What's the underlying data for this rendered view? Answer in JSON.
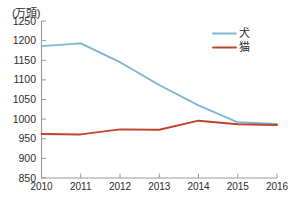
{
  "chart_data": {
    "type": "line",
    "title": "",
    "subtitle": "",
    "xlabel": "(年)",
    "ylabel": "(万頭)",
    "unit_note": "(万頭)",
    "x_unit_note": "(年)",
    "categories": [
      "2010",
      "2011",
      "2012",
      "2013",
      "2014",
      "2015",
      "2016"
    ],
    "x": [
      2010,
      2011,
      2012,
      2013,
      2014,
      2015,
      2016
    ],
    "xlim": [
      2010,
      2016
    ],
    "ylim": [
      850,
      1250
    ],
    "yticks": [
      "850",
      "900",
      "950",
      "1000",
      "1050",
      "1100",
      "1150",
      "1200",
      "1250"
    ],
    "ytick_values": [
      850,
      900,
      950,
      1000,
      1050,
      1100,
      1150,
      1200,
      1250
    ],
    "grid": false,
    "legend_position": "top-right",
    "series": [
      {
        "name": "犬",
        "color": "#7FB5D8",
        "values": [
          1186,
          1193,
          1145,
          1087,
          1035,
          992,
          988
        ]
      },
      {
        "name": "猫",
        "color": "#BE4430",
        "values": [
          962,
          961,
          974,
          973,
          996,
          987,
          985
        ]
      }
    ]
  },
  "legend": {
    "items": [
      {
        "label": "犬",
        "color": "#7FB5D8"
      },
      {
        "label": "猫",
        "color": "#BE4430"
      }
    ]
  },
  "axes": {
    "axis_color": "#9a9a9a",
    "tick_color": "#9a9a9a",
    "text_color": "#2b2b2b"
  }
}
